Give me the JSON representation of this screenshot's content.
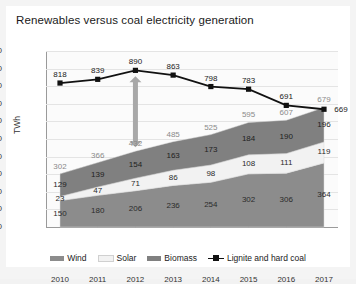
{
  "header": {
    "title": "Renewables versus coal electricity generation"
  },
  "axes": {
    "ylabel": "TWh",
    "yticks": [
      "1000",
      "900",
      "800",
      "700",
      "600",
      "500",
      "400",
      "300",
      "200",
      "100",
      "0"
    ],
    "xticks": [
      "2010",
      "2011",
      "2012",
      "2013",
      "2014",
      "2015",
      "2016",
      "2017"
    ]
  },
  "legend": {
    "items": [
      {
        "label": "Wind",
        "color": "#8c8c8c",
        "marker": "swatch"
      },
      {
        "label": "Solar",
        "color": "#f2f2f2",
        "marker": "swatch"
      },
      {
        "label": "Biomass",
        "color": "#808080",
        "marker": "swatch"
      },
      {
        "label": "Lignite and hard coal",
        "color": "#111111",
        "marker": "line"
      }
    ]
  },
  "annotation": {
    "name": "gap-arrow",
    "year": "2012",
    "color": "#a8a8a8"
  },
  "chart_data": {
    "type": "area",
    "title": "Renewables versus coal electricity generation",
    "xlabel": "",
    "ylabel": "TWh",
    "ylim": [
      0,
      1000
    ],
    "grid": true,
    "legend_position": "bottom",
    "stacked": true,
    "categories": [
      "2010",
      "2011",
      "2012",
      "2013",
      "2014",
      "2015",
      "2016",
      "2017"
    ],
    "series": [
      {
        "name": "Wind",
        "type": "area",
        "color": "#8c8c8c",
        "values": [
          150,
          180,
          206,
          236,
          254,
          302,
          306,
          364
        ]
      },
      {
        "name": "Solar",
        "type": "area",
        "color": "#f2f2f2",
        "values": [
          23,
          47,
          71,
          86,
          98,
          108,
          111,
          119
        ]
      },
      {
        "name": "Biomass",
        "type": "area",
        "color": "#808080",
        "values": [
          129,
          139,
          154,
          163,
          173,
          184,
          190,
          196
        ]
      },
      {
        "name": "Lignite and hard coal",
        "type": "line",
        "color": "#111111",
        "values": [
          818,
          839,
          890,
          863,
          798,
          783,
          691,
          669
        ]
      }
    ],
    "renewables_total": {
      "name": "Renewables total",
      "values": [
        302,
        366,
        432,
        485,
        525,
        595,
        607,
        679
      ]
    }
  }
}
